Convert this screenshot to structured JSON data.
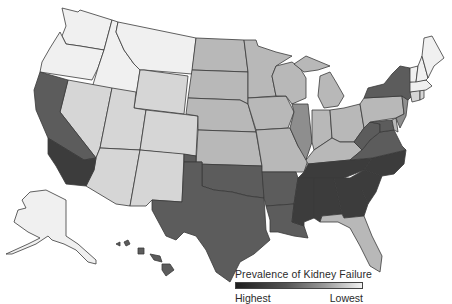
{
  "title": "Prevalence of Kidney Failure",
  "legend": {
    "title": "Prevalence of Kidney Failure",
    "low_label": "Lowest",
    "high_label": "Highest",
    "scale": "grayscale: dark = highest, light = lowest"
  },
  "levels": {
    "1": "#f0f0f0",
    "2": "#d6d6d6",
    "3": "#b8b8b8",
    "4": "#8e8e8e",
    "5": "#5c5c5c",
    "6": "#3c3c3c"
  },
  "states": [
    {
      "id": "WA",
      "level": 1
    },
    {
      "id": "OR",
      "level": 1
    },
    {
      "id": "ID",
      "level": 1
    },
    {
      "id": "MT",
      "level": 1
    },
    {
      "id": "WY",
      "level": 2
    },
    {
      "id": "NV",
      "level": 2
    },
    {
      "id": "UT",
      "level": 2
    },
    {
      "id": "CO",
      "level": 2
    },
    {
      "id": "AZ",
      "level": 2
    },
    {
      "id": "NM",
      "level": 2
    },
    {
      "id": "CA-N",
      "level": 5
    },
    {
      "id": "CA-S",
      "level": 6
    },
    {
      "id": "ND",
      "level": 3
    },
    {
      "id": "SD",
      "level": 3
    },
    {
      "id": "NE",
      "level": 3
    },
    {
      "id": "KS",
      "level": 3
    },
    {
      "id": "OK",
      "level": 5
    },
    {
      "id": "TX",
      "level": 5
    },
    {
      "id": "MN",
      "level": 3
    },
    {
      "id": "IA",
      "level": 3
    },
    {
      "id": "MO",
      "level": 3
    },
    {
      "id": "AR",
      "level": 5
    },
    {
      "id": "LA",
      "level": 5
    },
    {
      "id": "WI",
      "level": 3
    },
    {
      "id": "IL",
      "level": 4
    },
    {
      "id": "MI",
      "level": 3
    },
    {
      "id": "IN",
      "level": 3
    },
    {
      "id": "OH",
      "level": 3
    },
    {
      "id": "KY",
      "level": 3
    },
    {
      "id": "TN",
      "level": 6
    },
    {
      "id": "MS",
      "level": 6
    },
    {
      "id": "AL",
      "level": 6
    },
    {
      "id": "GA",
      "level": 6
    },
    {
      "id": "FL",
      "level": 3
    },
    {
      "id": "SC",
      "level": 6
    },
    {
      "id": "NC",
      "level": 6
    },
    {
      "id": "VA",
      "level": 5
    },
    {
      "id": "WV",
      "level": 5
    },
    {
      "id": "PA",
      "level": 3
    },
    {
      "id": "NY",
      "level": 5
    },
    {
      "id": "NJ",
      "level": 4
    },
    {
      "id": "DE",
      "level": 3
    },
    {
      "id": "MD",
      "level": 5
    },
    {
      "id": "CT",
      "level": 2
    },
    {
      "id": "RI",
      "level": 2
    },
    {
      "id": "MA",
      "level": 1
    },
    {
      "id": "VT",
      "level": 1
    },
    {
      "id": "NH",
      "level": 1
    },
    {
      "id": "ME",
      "level": 1
    },
    {
      "id": "AK",
      "level": 1
    },
    {
      "id": "HI",
      "level": 5
    }
  ]
}
